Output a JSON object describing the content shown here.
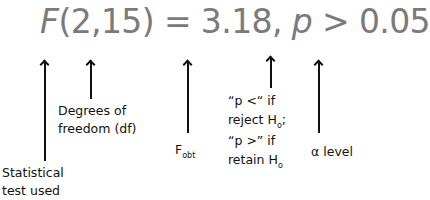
{
  "formula": {
    "stat": "F",
    "df": "(2,15)",
    "equals": " = 3.18, ",
    "p": "p",
    "relation": " > 0.05"
  },
  "annotations": {
    "statistical_test": [
      "Statistical",
      "test used"
    ],
    "degrees_of_freedom": [
      "Degrees of",
      "freedom (df)"
    ],
    "f_obt": {
      "main": "F",
      "sub": "obt"
    },
    "p_rule": {
      "line1": "“p <“ if",
      "line2_main": "reject H",
      "line2_sub": "o",
      "line2_end": ";",
      "line3": "“p >” if",
      "line4_main": "retain H",
      "line4_sub": "o"
    },
    "alpha": "α level"
  },
  "colors": {
    "formula": "#7a7a7a",
    "annotation": "#111111"
  }
}
